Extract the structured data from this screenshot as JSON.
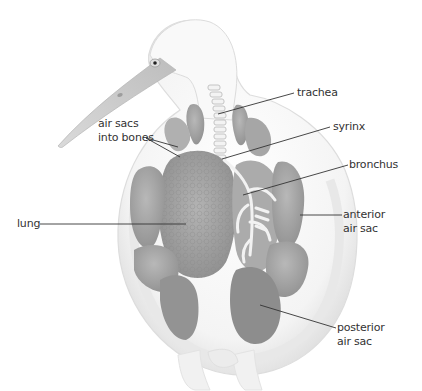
{
  "diagram": {
    "labels": {
      "trachea": "trachea",
      "syrinx": "syrinx",
      "bronchus": "bronchus",
      "air_sacs_bones_line1": "air sacs",
      "air_sacs_bones_line2": "into bones",
      "lung": "lung",
      "anterior_line1": "anterior",
      "anterior_line2": "air sac",
      "posterior_line1": "posterior",
      "posterior_line2": "air sac"
    },
    "colors": {
      "body_outline": "#e4e4e4",
      "body_fill": "#f7f7f7",
      "organ_dark": "#9a9a9a",
      "organ_mid": "#b5b5b5",
      "lung_fill": "#a8a8a8",
      "beak": "#c9c9c9",
      "leader_line": "#333333"
    }
  }
}
